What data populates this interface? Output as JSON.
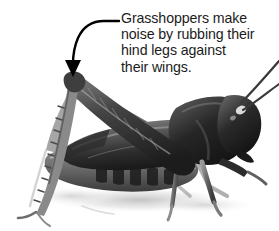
{
  "figure": {
    "name": "grasshopper-annotated-photo",
    "background_color": "#ffffff",
    "width": 279,
    "height": 231,
    "subject": "grasshopper",
    "photo_style": "black-and-white photograph"
  },
  "callout": {
    "text_color": "#1b1b1b",
    "lines": [
      "Grasshoppers make",
      "noise by rubbing their",
      "hind legs against",
      "their wings."
    ],
    "full_text": "Grasshoppers make noise by rubbing their hind legs against their wings.",
    "leader": {
      "icon": "curved-arrow-icon",
      "color": "#000000",
      "points_to": "hind leg knee",
      "arrowhead": "solid-triangle-down"
    }
  },
  "photo_parts": {
    "head": "head",
    "antennae": "antennae",
    "thorax": "thorax",
    "wing": "wing",
    "abdomen": "abdomen",
    "hind_leg": "hind leg",
    "front_legs": "front legs",
    "shadow": "ground shadow"
  }
}
